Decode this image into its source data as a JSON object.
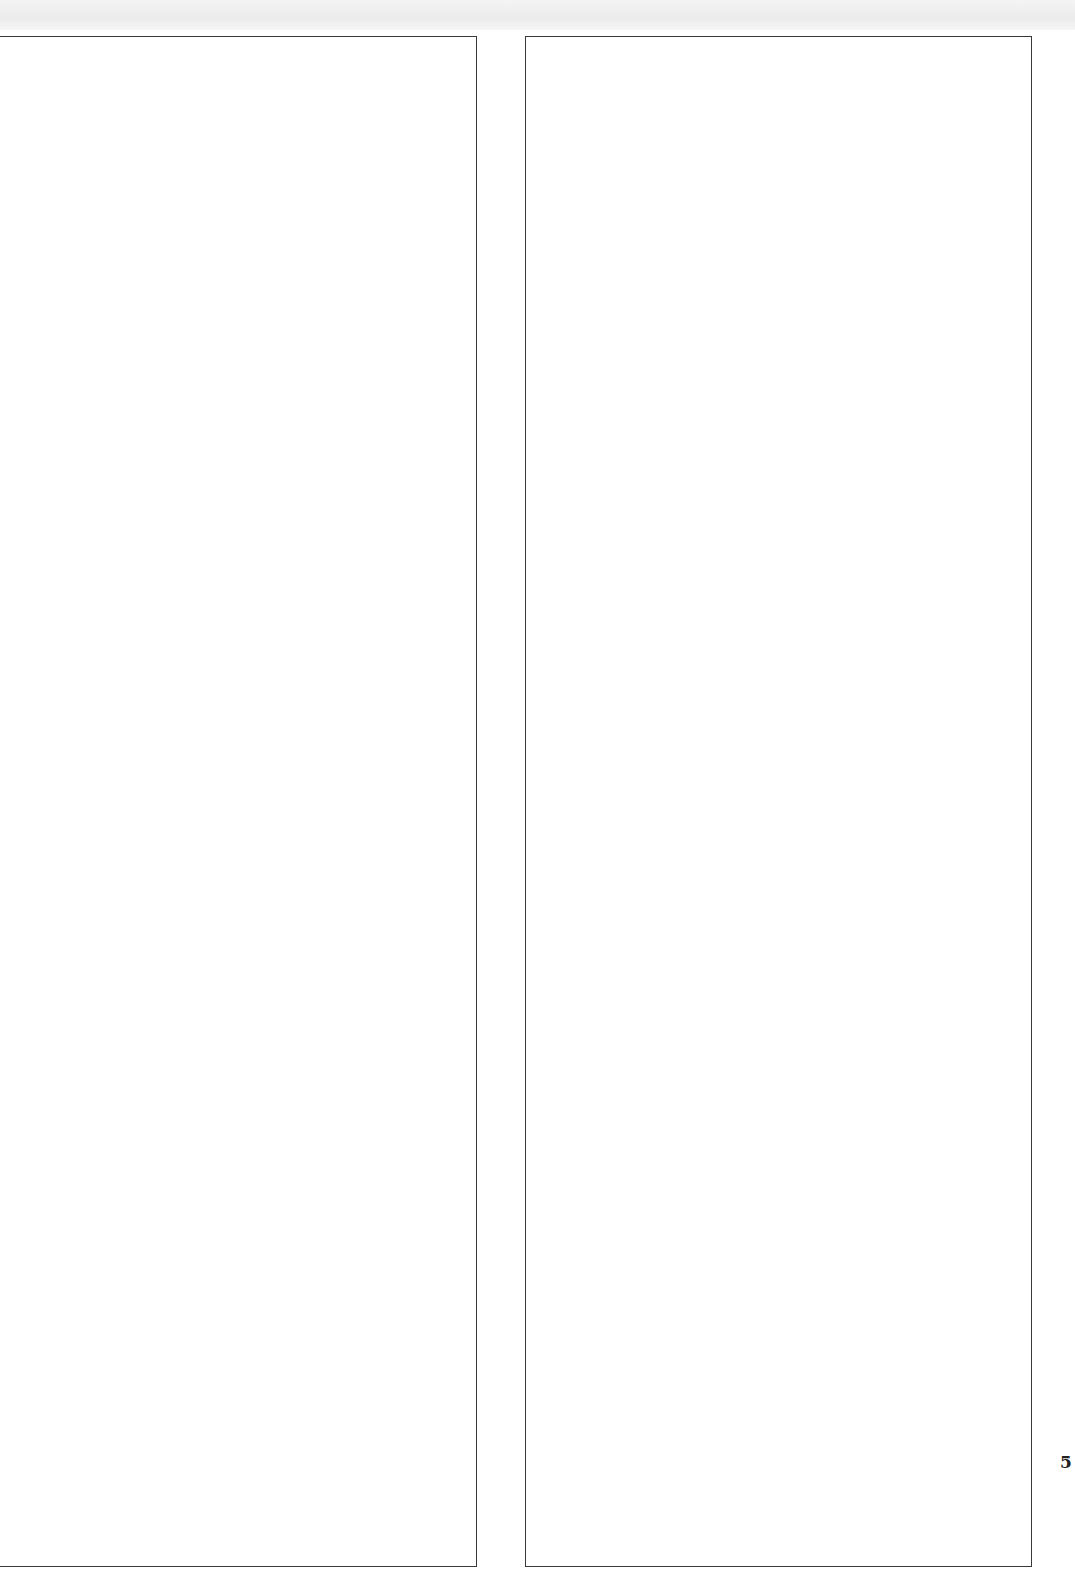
{
  "page": {
    "page_number": "5",
    "panels": [
      {
        "id": "left",
        "content": ""
      },
      {
        "id": "right",
        "content": ""
      }
    ]
  }
}
